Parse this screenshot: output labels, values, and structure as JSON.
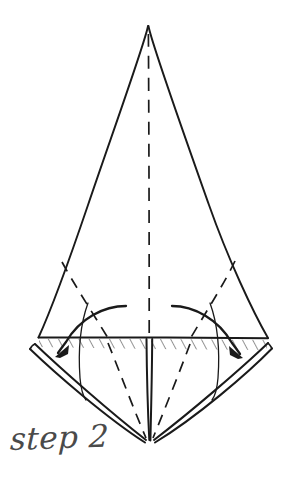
{
  "figure": {
    "caption": "step 2",
    "background_color": "#ffffff",
    "ink_color": "#1a1a1a",
    "caption_color": "#4a4a4a",
    "hatch_color": "#2b2b2b",
    "canvas": {
      "width": 288,
      "height": 487
    }
  },
  "geometry": {
    "apex": {
      "x": 148,
      "y": 26
    },
    "left_corner": {
      "x": 38,
      "y": 337
    },
    "right_corner": {
      "x": 268,
      "y": 338
    },
    "bottom_point": {
      "x": 150,
      "y": 441
    },
    "center_axis_x": 149,
    "fold_line_y": 337
  },
  "elements": {
    "outline_label": "kite-outline",
    "center_crease_label": "center-dashed-crease",
    "fold_line_label": "horizontal-fold-line",
    "hatch_band_label": "hatched-fold-band",
    "left_flap_label": "left-bottom-flap",
    "right_flap_label": "right-bottom-flap",
    "left_dashed_label": "left-dashed-crease",
    "right_dashed_label": "right-dashed-crease",
    "left_arrow_label": "left-fold-arrow",
    "right_arrow_label": "right-fold-arrow",
    "left_thin_arc_label": "left-thin-guide-arc",
    "right_thin_arc_label": "right-thin-guide-arc"
  },
  "arrows": {
    "left": {
      "from_x": 126,
      "from_y": 306,
      "to_x": 58,
      "to_y": 354,
      "direction": "down-left"
    },
    "right": {
      "from_x": 172,
      "from_y": 306,
      "to_x": 240,
      "to_y": 355,
      "direction": "down-right"
    }
  }
}
